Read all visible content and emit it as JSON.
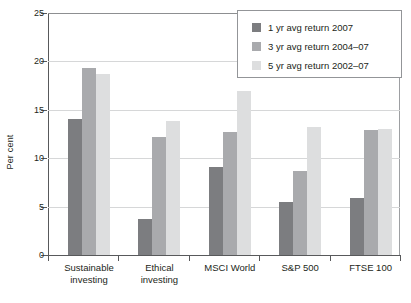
{
  "chart_data": {
    "type": "bar",
    "title": "",
    "xlabel": "",
    "ylabel": "Per cent",
    "ylim": [
      0,
      25
    ],
    "yticks": [
      0,
      5,
      10,
      15,
      20,
      25
    ],
    "grid": true,
    "legend_position": "top-right",
    "categories": [
      "Sustainable\ninvesting",
      "Ethical\ninvesting",
      "MSCI World",
      "S&P 500",
      "FTSE 100"
    ],
    "series": [
      {
        "name": "1 yr avg return 2007",
        "color": "#7c7d80",
        "values": [
          14.0,
          3.7,
          9.1,
          5.5,
          5.9
        ]
      },
      {
        "name": "3 yr avg return 2004–07",
        "color": "#a9aaad",
        "values": [
          19.3,
          12.2,
          12.7,
          8.7,
          12.9
        ]
      },
      {
        "name": "5 yr avg return 2002–07",
        "color": "#dddedf",
        "values": [
          18.7,
          13.8,
          16.9,
          13.2,
          13.0
        ]
      }
    ]
  },
  "axis": {
    "y_title": "Per cent",
    "y_tick_labels": [
      "0",
      "5",
      "10",
      "15",
      "20",
      "25"
    ]
  },
  "categories": [
    {
      "line1": "Sustainable",
      "line2": "investing"
    },
    {
      "line1": "Ethical",
      "line2": "investing"
    },
    {
      "line1": "MSCI World",
      "line2": ""
    },
    {
      "line1": "S&P 500",
      "line2": ""
    },
    {
      "line1": "FTSE 100",
      "line2": ""
    }
  ],
  "legend": {
    "items": [
      {
        "label": "1 yr avg return 2007",
        "color": "#7c7d80"
      },
      {
        "label": "3 yr avg return 2004–07",
        "color": "#a9aaad"
      },
      {
        "label": "5 yr avg return 2002–07",
        "color": "#dddedf"
      }
    ]
  },
  "colors": {
    "series_1": "#7c7d80",
    "series_2": "#a9aaad",
    "series_3": "#dddedf",
    "axis": "#58595b",
    "grid": "#d6d7d8",
    "background": "#ffffff"
  }
}
